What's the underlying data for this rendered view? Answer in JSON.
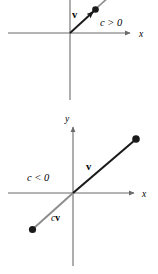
{
  "figure": {
    "width": 158,
    "height": 274,
    "background": "#ffffff",
    "colors": {
      "axis": "#6b6b6b",
      "vector": "#1a1a1a",
      "scaled_vector": "#8c8c8c",
      "text": "#000000"
    },
    "panels": [
      {
        "name": "positive-scalar-panel",
        "condition_label": "c > 0",
        "axis_x_label": "x",
        "axis_y_label": "",
        "vector_label": "v",
        "scaled_vector_label": "",
        "origin": {
          "x": 70,
          "y": 33
        },
        "x_axis": {
          "x1": 8,
          "x2": 132,
          "y": 33
        },
        "y_axis": {
          "x": 70,
          "y1": 0,
          "y2": 100
        },
        "vector": {
          "x1": 70,
          "y1": 33,
          "x2": 95,
          "y2": 10
        },
        "scaled_vector": {
          "x1": 95,
          "y1": 10,
          "x2": 128,
          "y2": -20
        },
        "endpoint": {
          "x": 95,
          "y": 10
        }
      },
      {
        "name": "negative-scalar-panel",
        "condition_label": "c < 0",
        "axis_x_label": "x",
        "axis_y_label": "y",
        "vector_label": "v",
        "scaled_vector_label_scalar": "c",
        "scaled_vector_label_vector": "v",
        "origin": {
          "x": 73,
          "y": 193
        },
        "x_axis": {
          "x1": 8,
          "x2": 136,
          "y": 193
        },
        "y_axis": {
          "x": 73,
          "y1": 126,
          "y2": 266
        },
        "vector": {
          "x1": 73,
          "y1": 193,
          "x2": 136,
          "y2": 139
        },
        "scaled_vector": {
          "x1": 73,
          "y1": 193,
          "x2": 33,
          "y2": 229
        },
        "endpoint_vector": {
          "x": 136,
          "y": 139
        },
        "endpoint_scaled": {
          "x": 33,
          "y": 229
        }
      }
    ]
  }
}
